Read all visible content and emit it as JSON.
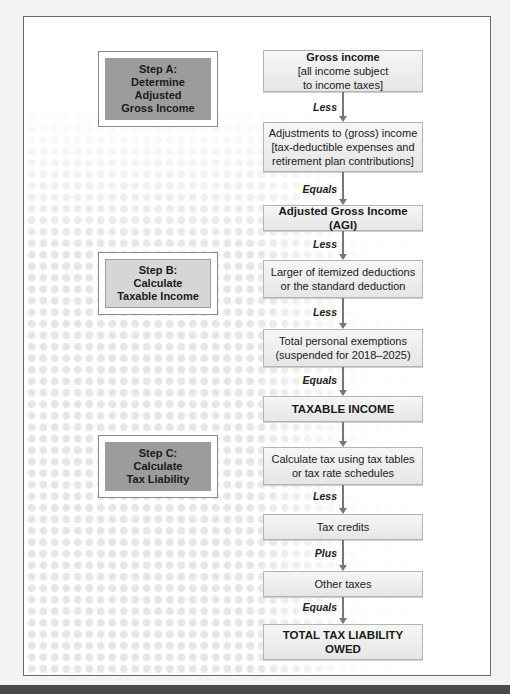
{
  "steps": [
    {
      "id": "A",
      "label_line1": "Step A:",
      "label_line2": "Determine Adjusted",
      "label_line3": "Gross Income"
    },
    {
      "id": "B",
      "label_line1": "Step B:",
      "label_line2": "Calculate",
      "label_line3": "Taxable Income"
    },
    {
      "id": "C",
      "label_line1": "Step C:",
      "label_line2": "Calculate",
      "label_line3": "Tax Liability"
    }
  ],
  "flow": {
    "boxes": [
      {
        "line1": "Gross income",
        "line2": "[all income subject",
        "line3": "to income taxes]"
      },
      {
        "line1": "Adjustments to (gross) income",
        "line2": "[tax-deductible expenses and",
        "line3": "retirement plan contributions]"
      },
      {
        "line1": "Adjusted Gross Income (AGI)"
      },
      {
        "line1": "Larger of itemized deductions",
        "line2": "or the standard deduction"
      },
      {
        "line1": "Total personal exemptions",
        "line2": "(suspended for 2018–2025)"
      },
      {
        "line1": "TAXABLE INCOME"
      },
      {
        "line1": "Calculate tax using tax tables",
        "line2": "or tax rate schedules"
      },
      {
        "line1": "Tax credits"
      },
      {
        "line1": "Other taxes"
      },
      {
        "line1": "TOTAL TAX LIABILITY OWED"
      }
    ],
    "operators": [
      "Less",
      "Equals",
      "Less",
      "Less",
      "Equals",
      "",
      "Less",
      "Plus",
      "Equals"
    ]
  },
  "colors": {
    "step_dark": "#9c9c9c",
    "step_light": "#d6d6d6",
    "connector": "#777777",
    "bottom_bar": "#4a4a4a"
  }
}
